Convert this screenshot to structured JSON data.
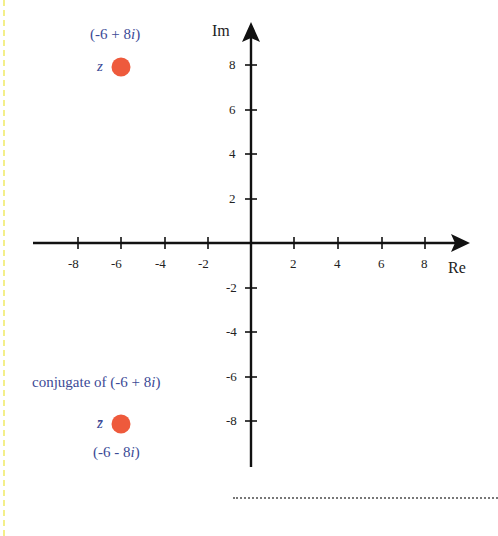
{
  "diagram": {
    "axes": {
      "real_label": "Re",
      "imag_label": "Im",
      "x_ticks": [
        "-8",
        "-6",
        "-4",
        "-2",
        "2",
        "4",
        "6",
        "8"
      ],
      "y_ticks": [
        "8",
        "6",
        "4",
        "2",
        "-2",
        "-4",
        "-6",
        "-8"
      ]
    },
    "point_z": {
      "symbol": "z",
      "value_prefix": "(-6 + 8",
      "value_i": "i",
      "value_suffix": ")",
      "re": -6,
      "im": 8
    },
    "point_conjugate": {
      "symbol": "z̄",
      "caption_prefix": "conjugate of (-6 + 8",
      "caption_i": "i",
      "caption_suffix": ")",
      "value_prefix": "(-6 - 8",
      "value_i": "i",
      "value_suffix": ")",
      "re": -6,
      "im": -8
    },
    "colors": {
      "point": "#ee5a3c",
      "label": "#3c4a96",
      "axis": "#111111",
      "left_border": "#f3ef8a"
    }
  }
}
